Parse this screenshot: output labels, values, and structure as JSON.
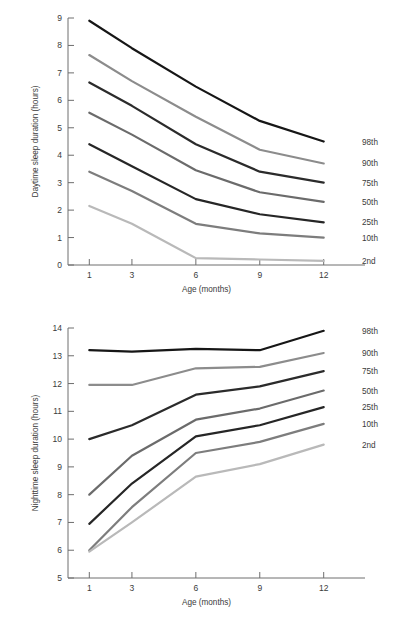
{
  "page": {
    "background_color": "#ffffff",
    "text_color": "#3b3b3b",
    "axis_color": "#6e6e6e"
  },
  "series_styles": {
    "98th": "#161616",
    "90th": "#8c8c8c",
    "75th": "#2b2b2b",
    "50th": "#6b6b6b",
    "25th": "#262626",
    "10th": "#7d7d7d",
    "2nd": "#b9b9b9"
  },
  "chart_data": [
    {
      "id": "daytime",
      "type": "line",
      "title": "",
      "xlabel": "Age (months)",
      "ylabel": "Daytime sleep duration (hours)",
      "x": [
        1,
        3,
        6,
        9,
        12
      ],
      "xticklabels": [
        "1",
        "3",
        "6",
        "9",
        "12"
      ],
      "xlim": [
        0,
        13
      ],
      "ylim": [
        0,
        9
      ],
      "yticks": [
        0,
        1,
        2,
        3,
        4,
        5,
        6,
        7,
        8,
        9
      ],
      "yticklabels": [
        "0",
        "1",
        "2",
        "3",
        "4",
        "5",
        "6",
        "7",
        "8",
        "9"
      ],
      "grid": false,
      "legend_position": "right-of-line-ends",
      "series": [
        {
          "name": "98th",
          "color": "#161616",
          "width": 2.2,
          "values": [
            8.9,
            7.9,
            6.5,
            5.25,
            4.5
          ]
        },
        {
          "name": "90th",
          "color": "#8c8c8c",
          "width": 2.2,
          "values": [
            7.65,
            6.7,
            5.4,
            4.2,
            3.7
          ]
        },
        {
          "name": "75th",
          "color": "#2b2b2b",
          "width": 2.2,
          "values": [
            6.65,
            5.8,
            4.4,
            3.4,
            3.0
          ]
        },
        {
          "name": "50th",
          "color": "#6b6b6b",
          "width": 2.2,
          "values": [
            5.55,
            4.75,
            3.45,
            2.65,
            2.3
          ]
        },
        {
          "name": "25th",
          "color": "#262626",
          "width": 2.2,
          "values": [
            4.4,
            3.6,
            2.4,
            1.85,
            1.55
          ]
        },
        {
          "name": "10th",
          "color": "#7d7d7d",
          "width": 2.2,
          "values": [
            3.4,
            2.7,
            1.5,
            1.15,
            1.0
          ]
        },
        {
          "name": "2nd",
          "color": "#b9b9b9",
          "width": 2.2,
          "values": [
            2.15,
            1.5,
            0.25,
            0.2,
            0.15
          ]
        }
      ]
    },
    {
      "id": "nighttime",
      "type": "line",
      "title": "",
      "xlabel": "Age (months)",
      "ylabel": "Nighttime sleep duration (hours)",
      "x": [
        1,
        3,
        6,
        9,
        12
      ],
      "xticklabels": [
        "1",
        "3",
        "6",
        "9",
        "12"
      ],
      "xlim": [
        0,
        13
      ],
      "ylim": [
        5,
        14
      ],
      "yticks": [
        5,
        6,
        7,
        8,
        9,
        10,
        11,
        12,
        13,
        14
      ],
      "yticklabels": [
        "5",
        "6",
        "7",
        "8",
        "9",
        "10",
        "11",
        "12",
        "13",
        "14"
      ],
      "grid": false,
      "legend_position": "right-of-line-ends",
      "series": [
        {
          "name": "98th",
          "color": "#161616",
          "width": 2.2,
          "values": [
            13.2,
            13.15,
            13.25,
            13.2,
            13.9
          ]
        },
        {
          "name": "90th",
          "color": "#8c8c8c",
          "width": 2.2,
          "values": [
            11.95,
            11.95,
            12.55,
            12.6,
            13.1
          ]
        },
        {
          "name": "75th",
          "color": "#2b2b2b",
          "width": 2.2,
          "values": [
            10.0,
            10.5,
            11.6,
            11.9,
            12.45
          ]
        },
        {
          "name": "50th",
          "color": "#6b6b6b",
          "width": 2.2,
          "values": [
            8.0,
            9.4,
            10.7,
            11.1,
            11.75
          ]
        },
        {
          "name": "25th",
          "color": "#262626",
          "width": 2.2,
          "values": [
            6.95,
            8.4,
            10.1,
            10.5,
            11.15
          ]
        },
        {
          "name": "10th",
          "color": "#7d7d7d",
          "width": 2.2,
          "values": [
            6.0,
            7.55,
            9.5,
            9.9,
            10.55
          ]
        },
        {
          "name": "2nd",
          "color": "#b9b9b9",
          "width": 2.2,
          "values": [
            5.95,
            7.0,
            8.65,
            9.1,
            9.8
          ]
        }
      ]
    }
  ]
}
